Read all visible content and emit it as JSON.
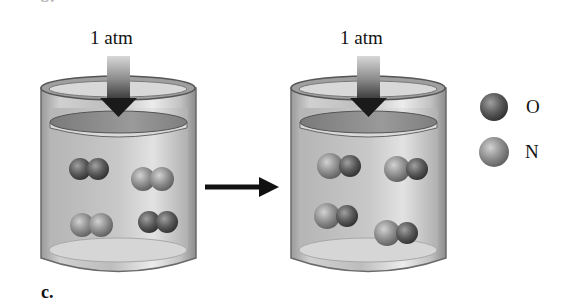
{
  "figure": {
    "top_cropped_label": "b.",
    "part_label": "c.",
    "process_arrow": "right-arrow"
  },
  "beakers": [
    {
      "name": "initial",
      "pressure_label": "1 atm",
      "molecules": [
        {
          "type": "O2",
          "atoms": [
            "O",
            "O"
          ],
          "cx": 90,
          "cy": 169
        },
        {
          "type": "N2",
          "atoms": [
            "N",
            "N"
          ],
          "cx": 153,
          "cy": 179
        },
        {
          "type": "N2",
          "atoms": [
            "N",
            "N"
          ],
          "cx": 92,
          "cy": 225
        },
        {
          "type": "O2",
          "atoms": [
            "O",
            "O"
          ],
          "cx": 158,
          "cy": 222
        }
      ]
    },
    {
      "name": "final",
      "pressure_label": "1 atm",
      "molecules": [
        {
          "type": "NO",
          "atoms": [
            "N",
            "O"
          ],
          "cx": 341,
          "cy": 166
        },
        {
          "type": "NO",
          "atoms": [
            "N",
            "O"
          ],
          "cx": 408,
          "cy": 169
        },
        {
          "type": "NO",
          "atoms": [
            "N",
            "O"
          ],
          "cx": 338,
          "cy": 216
        },
        {
          "type": "NO",
          "atoms": [
            "N",
            "O"
          ],
          "cx": 398,
          "cy": 233
        }
      ]
    }
  ],
  "legend": [
    {
      "symbol": "O",
      "color": "#5a5a5a"
    },
    {
      "symbol": "N",
      "color": "#8e8e8e"
    }
  ],
  "colors": {
    "oxygen": "#5a5a5a",
    "nitrogen": "#8e8e8e",
    "glass": "#c9c9c9",
    "piston": "#8a8a8a",
    "arrow": "#111111"
  }
}
